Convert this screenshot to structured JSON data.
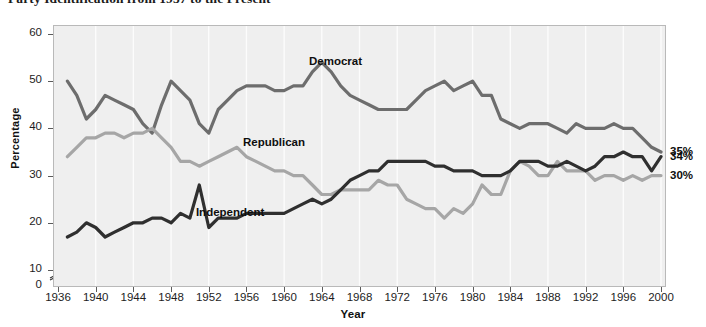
{
  "chart_data": {
    "type": "line",
    "title": "Party Identification from 1937 to the Present",
    "xlabel": "Year",
    "ylabel": "Percentage",
    "xlim": [
      1936,
      2000
    ],
    "ylim": [
      0,
      60
    ],
    "y_axis_break": true,
    "y_axis_break_note": "axis break between 0 and 10",
    "ytick_labels": [
      "0",
      "10",
      "20",
      "30",
      "40",
      "50",
      "60"
    ],
    "ytick_values": [
      0,
      10,
      20,
      30,
      40,
      50,
      60
    ],
    "xtick_labels": [
      "1936",
      "1940",
      "1944",
      "1948",
      "1952",
      "1956",
      "1960",
      "1964",
      "1968",
      "1972",
      "1976",
      "1980",
      "1984",
      "1988",
      "1992",
      "1996",
      "2000"
    ],
    "xtick_values": [
      1936,
      1940,
      1944,
      1948,
      1952,
      1956,
      1960,
      1964,
      1968,
      1972,
      1976,
      1980,
      1984,
      1988,
      1992,
      1996,
      2000
    ],
    "grid": "vertical gridlines only, faint white",
    "legend": "inline labels on plot",
    "plot_background": "#efefef",
    "series": [
      {
        "name": "Democrat",
        "color": "#6d6d6d",
        "label_x": 1962,
        "label_y": 54,
        "end_label": "35%",
        "x": [
          1937,
          1938,
          1939,
          1940,
          1941,
          1942,
          1943,
          1944,
          1945,
          1946,
          1947,
          1948,
          1949,
          1950,
          1951,
          1952,
          1953,
          1954,
          1955,
          1956,
          1957,
          1958,
          1959,
          1960,
          1961,
          1962,
          1963,
          1964,
          1965,
          1966,
          1967,
          1968,
          1969,
          1970,
          1971,
          1972,
          1973,
          1974,
          1975,
          1976,
          1977,
          1978,
          1979,
          1980,
          1981,
          1982,
          1983,
          1984,
          1985,
          1986,
          1987,
          1988,
          1989,
          1990,
          1991,
          1992,
          1993,
          1994,
          1995,
          1996,
          1997,
          1998,
          1999,
          2000
        ],
        "y": [
          50,
          47,
          42,
          44,
          47,
          46,
          45,
          44,
          41,
          39,
          45,
          50,
          48,
          46,
          41,
          39,
          44,
          46,
          48,
          49,
          49,
          49,
          48,
          48,
          49,
          49,
          52,
          54,
          52,
          49,
          47,
          46,
          45,
          44,
          44,
          44,
          44,
          46,
          48,
          49,
          50,
          48,
          49,
          50,
          47,
          47,
          42,
          41,
          40,
          41,
          41,
          41,
          40,
          39,
          41,
          40,
          40,
          40,
          41,
          40,
          40,
          38,
          36,
          35
        ]
      },
      {
        "name": "Republican",
        "color": "#a6a6a6",
        "label_x": 1955,
        "label_y": 37,
        "end_label": "30%",
        "x": [
          1937,
          1938,
          1939,
          1940,
          1941,
          1942,
          1943,
          1944,
          1945,
          1946,
          1947,
          1948,
          1949,
          1950,
          1951,
          1952,
          1953,
          1954,
          1955,
          1956,
          1957,
          1958,
          1959,
          1960,
          1961,
          1962,
          1963,
          1964,
          1965,
          1966,
          1967,
          1968,
          1969,
          1970,
          1971,
          1972,
          1973,
          1974,
          1975,
          1976,
          1977,
          1978,
          1979,
          1980,
          1981,
          1982,
          1983,
          1984,
          1985,
          1986,
          1987,
          1988,
          1989,
          1990,
          1991,
          1992,
          1993,
          1994,
          1995,
          1996,
          1997,
          1998,
          1999,
          2000
        ],
        "y": [
          34,
          36,
          38,
          38,
          39,
          39,
          38,
          39,
          39,
          40,
          38,
          36,
          33,
          33,
          32,
          33,
          34,
          35,
          36,
          34,
          33,
          32,
          31,
          31,
          30,
          30,
          28,
          26,
          26,
          27,
          27,
          27,
          27,
          29,
          28,
          28,
          25,
          24,
          23,
          23,
          21,
          23,
          22,
          24,
          28,
          26,
          26,
          31,
          33,
          32,
          30,
          30,
          33,
          31,
          31,
          31,
          29,
          30,
          30,
          29,
          30,
          29,
          30,
          30
        ]
      },
      {
        "name": "Independent",
        "color": "#2f2f2f",
        "label_x": 1950,
        "label_y": 22,
        "end_label": "34%",
        "x": [
          1937,
          1938,
          1939,
          1940,
          1941,
          1942,
          1943,
          1944,
          1945,
          1946,
          1947,
          1948,
          1949,
          1950,
          1951,
          1952,
          1953,
          1954,
          1955,
          1956,
          1957,
          1958,
          1959,
          1960,
          1961,
          1962,
          1963,
          1964,
          1965,
          1966,
          1967,
          1968,
          1969,
          1970,
          1971,
          1972,
          1973,
          1974,
          1975,
          1976,
          1977,
          1978,
          1979,
          1980,
          1981,
          1982,
          1983,
          1984,
          1985,
          1986,
          1987,
          1988,
          1989,
          1990,
          1991,
          1992,
          1993,
          1994,
          1995,
          1996,
          1997,
          1998,
          1999,
          2000
        ],
        "y": [
          17,
          18,
          20,
          19,
          17,
          18,
          19,
          20,
          20,
          21,
          21,
          20,
          22,
          21,
          28,
          19,
          21,
          21,
          21,
          22,
          22,
          22,
          22,
          22,
          23,
          24,
          25,
          24,
          25,
          27,
          29,
          30,
          31,
          31,
          33,
          33,
          33,
          33,
          33,
          32,
          32,
          31,
          31,
          31,
          30,
          30,
          30,
          31,
          33,
          33,
          33,
          32,
          32,
          33,
          32,
          31,
          32,
          34,
          34,
          35,
          34,
          34,
          31,
          34
        ]
      }
    ]
  }
}
